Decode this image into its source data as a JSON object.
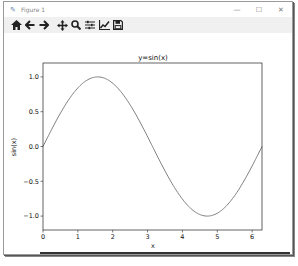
{
  "window": {
    "title": "Figure 1",
    "controls": {
      "minimize": "—",
      "maximize": "☐",
      "close": "✕"
    }
  },
  "toolbar": {
    "buttons": [
      {
        "name": "home-icon",
        "glyph": "⌂",
        "label": "Home"
      },
      {
        "name": "back-icon",
        "glyph": "←",
        "label": "Back"
      },
      {
        "name": "forward-icon",
        "glyph": "→",
        "label": "Forward"
      },
      {
        "name": "pan-icon",
        "glyph": "✥",
        "label": "Pan"
      },
      {
        "name": "zoom-icon",
        "glyph": "🔍",
        "label": "Zoom"
      },
      {
        "name": "subplots-icon",
        "glyph": "☰",
        "label": "Configure subplots"
      },
      {
        "name": "edit-axis-icon",
        "glyph": "📈",
        "label": "Edit axis"
      },
      {
        "name": "save-icon",
        "glyph": "💾",
        "label": "Save"
      }
    ]
  },
  "chart_data": {
    "type": "line",
    "title": "y=sin(x)",
    "xlabel": "x",
    "ylabel": "sin(x)",
    "xlim": [
      0,
      6.283
    ],
    "ylim": [
      -1.2,
      1.2
    ],
    "xticks": [
      0,
      1,
      2,
      3,
      4,
      5,
      6
    ],
    "xtick_labels": [
      "0",
      "1",
      "2",
      "3",
      "4",
      "5",
      "6"
    ],
    "yticks": [
      -1.0,
      -0.5,
      0.0,
      0.5,
      1.0
    ],
    "ytick_labels": [
      "−1.0",
      "−0.5",
      "0.0",
      "0.5",
      "1.0"
    ],
    "grid": false,
    "legend": null,
    "series": [
      {
        "name": "sin(x)",
        "color": "#7f7f7f",
        "x": [
          0,
          0.5,
          1.0,
          1.5708,
          2.0,
          2.5,
          3.1416,
          3.5,
          4.0,
          4.7124,
          5.0,
          5.5,
          6.2832
        ],
        "y": [
          0,
          0.479,
          0.841,
          1.0,
          0.909,
          0.598,
          0.0,
          -0.351,
          -0.757,
          -1.0,
          -0.959,
          -0.706,
          0.0
        ]
      }
    ]
  }
}
